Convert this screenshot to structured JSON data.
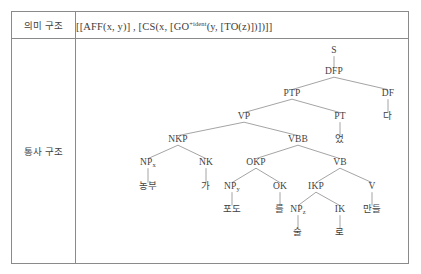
{
  "table": {
    "rows": [
      {
        "label": "의미 구조",
        "type": "semantic"
      },
      {
        "label": "통사 구조",
        "type": "syntactic"
      }
    ]
  },
  "semantic_structure": {
    "formula_prefix": "[[AFF(x, y)] , [CS(x, [GO",
    "formula_superscript": "+ident",
    "formula_suffix": "(y, [TO(z)])])]]",
    "formula_full": "[[AFF(x, y)] , [CS(x, [GO+ident(y, [TO(z)])])]]"
  },
  "syntax_tree": {
    "nodes": [
      {
        "id": "S",
        "label": "S",
        "sub": "",
        "x": 258,
        "y": 14,
        "kind": "nonterminal"
      },
      {
        "id": "DFP",
        "label": "DFP",
        "sub": "",
        "x": 258,
        "y": 35,
        "kind": "nonterminal"
      },
      {
        "id": "PTP",
        "label": "PTP",
        "sub": "",
        "x": 216,
        "y": 57,
        "kind": "nonterminal"
      },
      {
        "id": "DF",
        "label": "DF",
        "sub": "",
        "x": 312,
        "y": 57,
        "kind": "nonterminal"
      },
      {
        "id": "DFt",
        "label": "다",
        "sub": "",
        "x": 312,
        "y": 80,
        "kind": "terminal"
      },
      {
        "id": "VP",
        "label": "VP",
        "sub": "",
        "x": 168,
        "y": 80,
        "kind": "nonterminal"
      },
      {
        "id": "PT",
        "label": "PT",
        "sub": "",
        "x": 264,
        "y": 80,
        "kind": "nonterminal"
      },
      {
        "id": "PTt",
        "label": "었",
        "sub": "",
        "x": 264,
        "y": 103,
        "kind": "terminal"
      },
      {
        "id": "NKP",
        "label": "NKP",
        "sub": "",
        "x": 102,
        "y": 103,
        "kind": "nonterminal"
      },
      {
        "id": "VBB",
        "label": "VBB",
        "sub": "",
        "x": 222,
        "y": 103,
        "kind": "nonterminal"
      },
      {
        "id": "NPx",
        "label": "NP",
        "sub": "x",
        "x": 72,
        "y": 126,
        "kind": "nonterminal"
      },
      {
        "id": "NK",
        "label": "NK",
        "sub": "",
        "x": 130,
        "y": 126,
        "kind": "nonterminal"
      },
      {
        "id": "NPxt",
        "label": "농부",
        "sub": "",
        "x": 72,
        "y": 150,
        "kind": "terminal"
      },
      {
        "id": "NKt",
        "label": "가",
        "sub": "",
        "x": 130,
        "y": 150,
        "kind": "terminal"
      },
      {
        "id": "OKP",
        "label": "OKP",
        "sub": "",
        "x": 180,
        "y": 126,
        "kind": "nonterminal"
      },
      {
        "id": "VB",
        "label": "VB",
        "sub": "",
        "x": 264,
        "y": 126,
        "kind": "nonterminal"
      },
      {
        "id": "NPy",
        "label": "NP",
        "sub": "y",
        "x": 156,
        "y": 150,
        "kind": "nonterminal"
      },
      {
        "id": "OK",
        "label": "OK",
        "sub": "",
        "x": 204,
        "y": 150,
        "kind": "nonterminal"
      },
      {
        "id": "NPyt",
        "label": "포도",
        "sub": "",
        "x": 156,
        "y": 173,
        "kind": "terminal"
      },
      {
        "id": "OKt",
        "label": "를",
        "sub": "",
        "x": 204,
        "y": 173,
        "kind": "terminal"
      },
      {
        "id": "IKP",
        "label": "IKP",
        "sub": "",
        "x": 240,
        "y": 150,
        "kind": "nonterminal"
      },
      {
        "id": "V",
        "label": "V",
        "sub": "",
        "x": 296,
        "y": 150,
        "kind": "nonterminal"
      },
      {
        "id": "NPz",
        "label": "NP",
        "sub": "z",
        "x": 222,
        "y": 173,
        "kind": "nonterminal"
      },
      {
        "id": "IK",
        "label": "IK",
        "sub": "",
        "x": 264,
        "y": 173,
        "kind": "nonterminal"
      },
      {
        "id": "Vt",
        "label": "만들",
        "sub": "",
        "x": 296,
        "y": 173,
        "kind": "terminal"
      },
      {
        "id": "NPzt",
        "label": "술",
        "sub": "",
        "x": 222,
        "y": 196,
        "kind": "terminal"
      },
      {
        "id": "IKt",
        "label": "로",
        "sub": "",
        "x": 264,
        "y": 196,
        "kind": "terminal"
      }
    ],
    "edges": [
      {
        "from": "S",
        "to": "DFP"
      },
      {
        "from": "DFP",
        "to": "PTP"
      },
      {
        "from": "DFP",
        "to": "DF"
      },
      {
        "from": "DF",
        "to": "DFt"
      },
      {
        "from": "PTP",
        "to": "VP"
      },
      {
        "from": "PTP",
        "to": "PT"
      },
      {
        "from": "PT",
        "to": "PTt"
      },
      {
        "from": "VP",
        "to": "NKP"
      },
      {
        "from": "VP",
        "to": "VBB"
      },
      {
        "from": "NKP",
        "to": "NPx"
      },
      {
        "from": "NKP",
        "to": "NK"
      },
      {
        "from": "NPx",
        "to": "NPxt"
      },
      {
        "from": "NK",
        "to": "NKt"
      },
      {
        "from": "VBB",
        "to": "OKP"
      },
      {
        "from": "VBB",
        "to": "VB"
      },
      {
        "from": "OKP",
        "to": "NPy"
      },
      {
        "from": "OKP",
        "to": "OK"
      },
      {
        "from": "NPy",
        "to": "NPyt"
      },
      {
        "from": "OK",
        "to": "OKt"
      },
      {
        "from": "VB",
        "to": "IKP"
      },
      {
        "from": "VB",
        "to": "V"
      },
      {
        "from": "IKP",
        "to": "NPz"
      },
      {
        "from": "IKP",
        "to": "IK"
      },
      {
        "from": "V",
        "to": "Vt"
      },
      {
        "from": "NPz",
        "to": "NPzt"
      },
      {
        "from": "IK",
        "to": "IKt"
      }
    ]
  },
  "colors": {
    "border": "#8a8a8a",
    "text": "#3c3c3c",
    "branch": "#8d8d8d",
    "background": "#ffffff"
  }
}
